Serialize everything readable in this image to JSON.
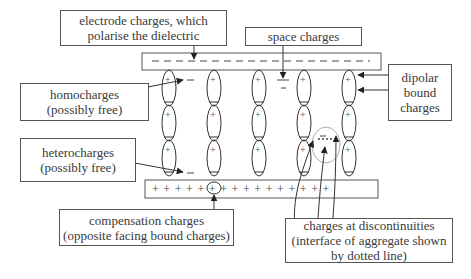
{
  "diagram": {
    "labels": {
      "electrode_charges": [
        "electrode charges, which",
        "polarise the dielectric"
      ],
      "space_charges": [
        "space charges"
      ],
      "dipolar_bound_charges": [
        "dipolar",
        "bound",
        "charges"
      ],
      "homocharges": [
        "homocharges",
        "(possibly free)"
      ],
      "heterocharges": [
        "heterocharges",
        "(possibly free)"
      ],
      "compensation_charges": [
        "compensation charges",
        "(opposite facing bound charges)"
      ],
      "charges_at_discontinuities": [
        "charges at discontinuities",
        "(interface of aggregate shown",
        "by dotted line)"
      ]
    },
    "top_electrode": {
      "charge_symbol": "−",
      "charge_count": 16
    },
    "bottom_electrode": {
      "charge_symbol": "+",
      "charge_count": 16,
      "text": "+ + + + + + + + + + + + + + + +"
    },
    "dipole_columns": 5,
    "dipoles_per_column": 3,
    "dipole_symbols": {
      "top": "+",
      "bottom": "−"
    },
    "colors": {
      "stroke": "#333333",
      "text": "#3a3a3a",
      "circle_highlight": "#999999"
    }
  }
}
